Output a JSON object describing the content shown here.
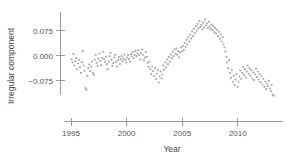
{
  "chart_data": {
    "type": "scatter",
    "title": "",
    "xlabel": "Year",
    "ylabel": "Irregular component",
    "xlim": [
      1994.4,
      2013.6
    ],
    "ylim": [
      -0.125,
      0.118
    ],
    "xticks": [
      1995,
      2000,
      2005,
      2010
    ],
    "xticklabels": [
      "1995",
      "2000",
      "2005",
      "2010"
    ],
    "yticks": [
      0.075,
      0.0,
      -0.075
    ],
    "yticklabels": [
      "0.075",
      "0.000",
      "−0.075"
    ],
    "grid": false,
    "legend": null,
    "marker": {
      "shape": "circle",
      "color": "#ababab",
      "size": 2.2
    },
    "series": [
      {
        "name": "Irregular component",
        "points": [
          [
            1995.05,
            -0.012
          ],
          [
            1995.14,
            -0.021
          ],
          [
            1995.22,
            0.004
          ],
          [
            1995.3,
            -0.03
          ],
          [
            1995.39,
            -0.017
          ],
          [
            1995.47,
            -0.008
          ],
          [
            1995.55,
            -0.041
          ],
          [
            1995.64,
            -0.024
          ],
          [
            1995.72,
            -0.013
          ],
          [
            1995.8,
            -0.035
          ],
          [
            1995.89,
            -0.052
          ],
          [
            1995.97,
            -0.02
          ],
          [
            1996.05,
            0.013
          ],
          [
            1996.14,
            -0.03
          ],
          [
            1996.22,
            -0.046
          ],
          [
            1996.3,
            -0.098
          ],
          [
            1996.39,
            -0.103
          ],
          [
            1996.47,
            -0.061
          ],
          [
            1996.55,
            -0.038
          ],
          [
            1996.64,
            -0.027
          ],
          [
            1996.72,
            -0.047
          ],
          [
            1996.8,
            -0.033
          ],
          [
            1996.89,
            -0.018
          ],
          [
            1996.97,
            -0.052
          ],
          [
            1997.05,
            -0.058
          ],
          [
            1997.14,
            -0.013
          ],
          [
            1997.22,
            0.002
          ],
          [
            1997.3,
            -0.022
          ],
          [
            1997.39,
            -0.031
          ],
          [
            1997.47,
            -0.009
          ],
          [
            1997.55,
            0.006
          ],
          [
            1997.64,
            -0.016
          ],
          [
            1997.72,
            -0.029
          ],
          [
            1997.8,
            -0.007
          ],
          [
            1997.89,
            0.012
          ],
          [
            1997.97,
            -0.011
          ],
          [
            1998.05,
            -0.019
          ],
          [
            1998.14,
            -0.004
          ],
          [
            1998.22,
            -0.026
          ],
          [
            1998.3,
            -0.041
          ],
          [
            1998.39,
            -0.018
          ],
          [
            1998.47,
            -0.002
          ],
          [
            1998.55,
            0.008
          ],
          [
            1998.64,
            -0.013
          ],
          [
            1998.72,
            -0.031
          ],
          [
            1998.8,
            -0.023
          ],
          [
            1998.89,
            -0.006
          ],
          [
            1998.97,
            0.002
          ],
          [
            1999.05,
            -0.02
          ],
          [
            1999.14,
            -0.033
          ],
          [
            1999.22,
            -0.014
          ],
          [
            1999.3,
            -0.005
          ],
          [
            1999.39,
            -0.026
          ],
          [
            1999.47,
            -0.011
          ],
          [
            1999.55,
            -0.002
          ],
          [
            1999.64,
            -0.017
          ],
          [
            1999.72,
            -0.009
          ],
          [
            1999.8,
            0.003
          ],
          [
            1999.89,
            -0.013
          ],
          [
            1999.97,
            -0.021
          ],
          [
            2000.05,
            -0.006
          ],
          [
            2000.14,
            0.001
          ],
          [
            2000.22,
            -0.01
          ],
          [
            2000.3,
            -0.018
          ],
          [
            2000.39,
            0.004
          ],
          [
            2000.47,
            -0.003
          ],
          [
            2000.55,
            0.01
          ],
          [
            2000.64,
            -0.008
          ],
          [
            2000.72,
            0.002
          ],
          [
            2000.8,
            0.013
          ],
          [
            2000.89,
            -0.002
          ],
          [
            2000.97,
            0.006
          ],
          [
            2001.05,
            0.016
          ],
          [
            2001.14,
            0.001
          ],
          [
            2001.22,
            -0.012
          ],
          [
            2001.3,
            0.008
          ],
          [
            2001.39,
            0.018
          ],
          [
            2001.47,
            0.002
          ],
          [
            2001.55,
            -0.014
          ],
          [
            2001.64,
            -0.006
          ],
          [
            2001.72,
            0.011
          ],
          [
            2001.8,
            -0.004
          ],
          [
            2001.89,
            -0.022
          ],
          [
            2001.97,
            -0.034
          ],
          [
            2002.05,
            -0.018
          ],
          [
            2002.14,
            -0.041
          ],
          [
            2002.22,
            -0.056
          ],
          [
            2002.3,
            -0.033
          ],
          [
            2002.39,
            -0.047
          ],
          [
            2002.47,
            -0.062
          ],
          [
            2002.55,
            -0.038
          ],
          [
            2002.64,
            -0.071
          ],
          [
            2002.72,
            -0.055
          ],
          [
            2002.8,
            -0.044
          ],
          [
            2002.89,
            -0.081
          ],
          [
            2002.97,
            -0.063
          ],
          [
            2003.05,
            -0.048
          ],
          [
            2003.14,
            -0.069
          ],
          [
            2003.22,
            -0.057
          ],
          [
            2003.3,
            -0.03
          ],
          [
            2003.39,
            -0.043
          ],
          [
            2003.47,
            -0.021
          ],
          [
            2003.55,
            -0.036
          ],
          [
            2003.64,
            -0.012
          ],
          [
            2003.72,
            -0.026
          ],
          [
            2003.8,
            -0.004
          ],
          [
            2003.89,
            -0.018
          ],
          [
            2003.97,
            0.003
          ],
          [
            2004.05,
            -0.008
          ],
          [
            2004.14,
            0.011
          ],
          [
            2004.22,
            -0.002
          ],
          [
            2004.3,
            0.018
          ],
          [
            2004.39,
            0.006
          ],
          [
            2004.47,
            0.021
          ],
          [
            2004.55,
            0.002
          ],
          [
            2004.64,
            0.013
          ],
          [
            2004.72,
            -0.006
          ],
          [
            2004.8,
            0.009
          ],
          [
            2004.89,
            0.024
          ],
          [
            2004.97,
            0.012
          ],
          [
            2005.05,
            0.028
          ],
          [
            2005.14,
            0.016
          ],
          [
            2005.22,
            0.038
          ],
          [
            2005.3,
            0.026
          ],
          [
            2005.39,
            0.047
          ],
          [
            2005.47,
            0.033
          ],
          [
            2005.55,
            0.055
          ],
          [
            2005.64,
            0.042
          ],
          [
            2005.72,
            0.063
          ],
          [
            2005.8,
            0.051
          ],
          [
            2005.89,
            0.072
          ],
          [
            2005.97,
            0.058
          ],
          [
            2006.05,
            0.08
          ],
          [
            2006.14,
            0.067
          ],
          [
            2006.22,
            0.088
          ],
          [
            2006.3,
            0.074
          ],
          [
            2006.39,
            0.095
          ],
          [
            2006.47,
            0.082
          ],
          [
            2006.55,
            0.103
          ],
          [
            2006.64,
            0.086
          ],
          [
            2006.72,
            0.092
          ],
          [
            2006.8,
            0.078
          ],
          [
            2006.89,
            0.099
          ],
          [
            2006.97,
            0.084
          ],
          [
            2007.05,
            0.108
          ],
          [
            2007.14,
            0.09
          ],
          [
            2007.22,
            0.096
          ],
          [
            2007.3,
            0.083
          ],
          [
            2007.39,
            0.101
          ],
          [
            2007.47,
            0.087
          ],
          [
            2007.55,
            0.079
          ],
          [
            2007.64,
            0.093
          ],
          [
            2007.72,
            0.076
          ],
          [
            2007.8,
            0.088
          ],
          [
            2007.89,
            0.07
          ],
          [
            2007.97,
            0.082
          ],
          [
            2008.05,
            0.066
          ],
          [
            2008.14,
            0.077
          ],
          [
            2008.22,
            0.058
          ],
          [
            2008.3,
            0.071
          ],
          [
            2008.39,
            0.05
          ],
          [
            2008.47,
            0.063
          ],
          [
            2008.55,
            0.042
          ],
          [
            2008.64,
            0.055
          ],
          [
            2008.72,
            0.033
          ],
          [
            2008.8,
            0.024
          ],
          [
            2008.89,
            0.012
          ],
          [
            2008.97,
            -0.004
          ],
          [
            2009.05,
            -0.021
          ],
          [
            2009.14,
            -0.038
          ],
          [
            2009.22,
            -0.014
          ],
          [
            2009.3,
            -0.052
          ],
          [
            2009.39,
            -0.067
          ],
          [
            2009.47,
            -0.044
          ],
          [
            2009.55,
            -0.079
          ],
          [
            2009.64,
            -0.061
          ],
          [
            2009.72,
            -0.088
          ],
          [
            2009.8,
            -0.072
          ],
          [
            2009.89,
            -0.056
          ],
          [
            2009.97,
            -0.094
          ],
          [
            2010.05,
            -0.078
          ],
          [
            2010.14,
            -0.063
          ],
          [
            2010.22,
            -0.045
          ],
          [
            2010.3,
            -0.07
          ],
          [
            2010.39,
            -0.052
          ],
          [
            2010.47,
            -0.034
          ],
          [
            2010.55,
            -0.058
          ],
          [
            2010.64,
            -0.041
          ],
          [
            2010.72,
            -0.066
          ],
          [
            2010.8,
            -0.048
          ],
          [
            2010.89,
            -0.03
          ],
          [
            2010.97,
            -0.055
          ],
          [
            2011.05,
            -0.038
          ],
          [
            2011.14,
            -0.061
          ],
          [
            2011.22,
            -0.044
          ],
          [
            2011.3,
            -0.069
          ],
          [
            2011.39,
            -0.051
          ],
          [
            2011.47,
            -0.074
          ],
          [
            2011.55,
            -0.057
          ],
          [
            2011.64,
            -0.04
          ],
          [
            2011.72,
            -0.065
          ],
          [
            2011.8,
            -0.048
          ],
          [
            2011.89,
            -0.072
          ],
          [
            2011.97,
            -0.056
          ],
          [
            2012.05,
            -0.08
          ],
          [
            2012.14,
            -0.063
          ],
          [
            2012.22,
            -0.087
          ],
          [
            2012.3,
            -0.07
          ],
          [
            2012.39,
            -0.094
          ],
          [
            2012.47,
            -0.078
          ],
          [
            2012.55,
            -0.101
          ],
          [
            2012.64,
            -0.084
          ],
          [
            2012.72,
            -0.092
          ],
          [
            2012.8,
            -0.076
          ],
          [
            2012.89,
            -0.099
          ],
          [
            2012.97,
            -0.107
          ],
          [
            2013.05,
            -0.088
          ],
          [
            2013.14,
            -0.118
          ],
          [
            2013.22,
            -0.121
          ]
        ]
      }
    ]
  }
}
